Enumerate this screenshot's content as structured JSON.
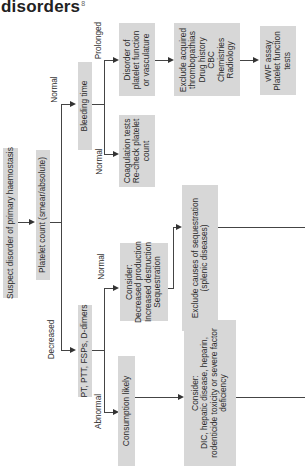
{
  "title": {
    "text": "disorders",
    "footnote": "8"
  },
  "nodes": {
    "suspect": "Suspect disorder of primary haemostasis",
    "platelet_count": "Platelet count (smear/absolute)",
    "bleeding_time": "Bleeding time",
    "pt_ptt": "PT, PTT, FSPs, D-dimers",
    "disorder_platelet": [
      "Disorder of",
      "platelet function",
      "or vasculature"
    ],
    "exclude_acquired": [
      "Exclude acquired",
      "thrombopathias",
      "Drug history",
      "CBC",
      "Chemistries",
      "Radiology"
    ],
    "vwf": [
      "vWF assay",
      "Platelet function",
      "tests"
    ],
    "coag_tests": [
      "Coagulation tests",
      "Re-check platelet",
      "count"
    ],
    "consider_decreased": [
      "Consider:",
      "Decreased production",
      "Increased destruction",
      "Sequestration"
    ],
    "exclude_sequestration": [
      "Exclude causes of sequestration",
      "(splenic diseases)"
    ],
    "consumption": "Consumption likely",
    "consider_dic": [
      "Consider:",
      "DIC, hepatic disease, heparin,",
      "rodenticide toxicity or severe factor",
      "deficiency"
    ]
  },
  "edge_labels": {
    "normal_top": "Normal",
    "decreased": "Decreased",
    "prolonged": "Prolonged",
    "normal_bleeding": "Normal",
    "normal_pt": "Normal",
    "abnormal": "Abnormal"
  },
  "colors": {
    "box": "#d7d7d7",
    "line": "#444444",
    "text": "#2b2b2b"
  }
}
